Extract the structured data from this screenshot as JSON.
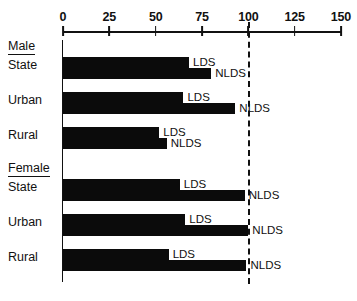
{
  "chart_data": {
    "type": "bar",
    "orientation": "horizontal",
    "title": "",
    "xlabel": "",
    "ylabel": "",
    "xlim": [
      0,
      150
    ],
    "grid": false,
    "legend_position": "inline-bar-labels",
    "axis_ticks": [
      0,
      25,
      50,
      75,
      100,
      125,
      150
    ],
    "tick_labels": [
      "0",
      "25",
      "50",
      "75",
      "100",
      "125",
      "150"
    ],
    "reference_line": {
      "value": 100,
      "style": "dashed",
      "color": "#111111"
    },
    "series": [
      {
        "name": "LDS",
        "values": [
          68,
          65,
          52,
          63,
          66,
          57
        ]
      },
      {
        "name": "NLDS",
        "values": [
          80,
          93,
          56,
          98,
          100,
          99
        ]
      }
    ],
    "sections": [
      {
        "label": "Male",
        "rows": [
          {
            "label": "State",
            "bars": [
              {
                "series": "LDS",
                "value": 68
              },
              {
                "series": "NLDS",
                "value": 80
              }
            ]
          },
          {
            "label": "Urban",
            "bars": [
              {
                "series": "LDS",
                "value": 65
              },
              {
                "series": "NLDS",
                "value": 93
              }
            ]
          },
          {
            "label": "Rural",
            "bars": [
              {
                "series": "LDS",
                "value": 52
              },
              {
                "series": "NLDS",
                "value": 56
              }
            ]
          }
        ]
      },
      {
        "label": "Female",
        "rows": [
          {
            "label": "State",
            "bars": [
              {
                "series": "LDS",
                "value": 63
              },
              {
                "series": "NLDS",
                "value": 98
              }
            ]
          },
          {
            "label": "Urban",
            "bars": [
              {
                "series": "LDS",
                "value": 66
              },
              {
                "series": "NLDS",
                "value": 100
              }
            ]
          },
          {
            "label": "Rural",
            "bars": [
              {
                "series": "LDS",
                "value": 57
              },
              {
                "series": "NLDS",
                "value": 99
              }
            ]
          }
        ]
      }
    ],
    "colors": {
      "bar": "#0b0b0b",
      "axis": "#111111",
      "background": "#ffffff"
    }
  }
}
